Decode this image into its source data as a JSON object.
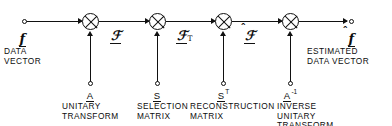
{
  "diagram": {
    "input": {
      "terminal_name": "input-terminal",
      "symbol": "f",
      "caption": "DATA\nVECTOR"
    },
    "output": {
      "terminal_name": "output-terminal",
      "symbol": "f",
      "accent": "hat",
      "caption": "ESTIMATED\nDATA VECTOR"
    },
    "path_symbols": [
      {
        "symbol": "ℱ",
        "subscript": "",
        "accent": "none",
        "label": "transformed-vector"
      },
      {
        "symbol": "ℱ",
        "subscript": "T",
        "accent": "none",
        "label": "truncated-vector"
      },
      {
        "symbol": "ℱ",
        "subscript": "",
        "accent": "hat",
        "label": "reconstructed-vector"
      }
    ],
    "stages": [
      {
        "operator": "A",
        "superscript": "",
        "caption": "UNITARY\nTRANSFORM"
      },
      {
        "operator": "S",
        "superscript": "",
        "caption": "SELECTION\nMATRIX"
      },
      {
        "operator": "S",
        "superscript": "T",
        "caption": "RECONSTRUCTION\nMATRIX"
      },
      {
        "operator": "A",
        "superscript": "-1",
        "caption": "INVERSE\nUNITARY\nTRANSFORM"
      }
    ],
    "node_symbol": "multiply",
    "colors": {
      "line": "#111111",
      "text": "#0d0d0d",
      "background": "#ffffff"
    }
  }
}
